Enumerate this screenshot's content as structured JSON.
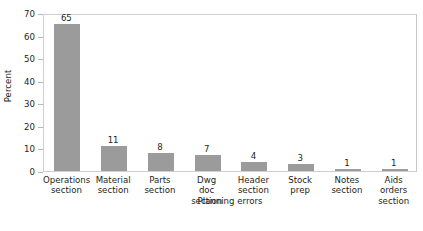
{
  "chart_data": {
    "type": "bar",
    "title": "",
    "subtitle": "",
    "xlabel": "Planning errors",
    "ylabel": "Percent",
    "categories": [
      "Operations section",
      "Material section",
      "Parts section",
      "Dwg doc section",
      "Header section",
      "Stock prep",
      "Notes section",
      "Aids orders section"
    ],
    "category_lines": [
      [
        "Operations",
        "section"
      ],
      [
        "Material",
        "section"
      ],
      [
        "Parts",
        "section"
      ],
      [
        "Dwg",
        "doc",
        "section"
      ],
      [
        "Header",
        "section"
      ],
      [
        "Stock",
        "prep"
      ],
      [
        "Notes",
        "section"
      ],
      [
        "Aids",
        "orders",
        "section"
      ]
    ],
    "values": [
      65,
      11,
      8,
      7,
      4,
      3,
      1,
      1
    ],
    "value_labels": [
      "65",
      "11",
      "8",
      "7",
      "4",
      "3",
      "1",
      "1"
    ],
    "ylim": [
      0,
      70
    ],
    "yticks": [
      0,
      10,
      20,
      30,
      40,
      50,
      60,
      70
    ],
    "ytick_labels": [
      "0",
      "10",
      "20",
      "30",
      "40",
      "50",
      "60",
      "70"
    ],
    "grid": false,
    "legend": false,
    "legend_position": "none",
    "bar_color": "#9b9b9b",
    "frame_color": "#cfcfcf",
    "background_color": "#ffffff",
    "text_color": "#231f20"
  }
}
